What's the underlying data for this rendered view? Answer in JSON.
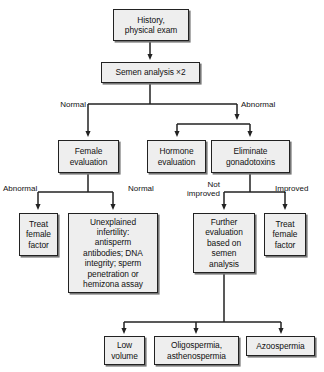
{
  "diagram": {
    "type": "flowchart",
    "colors": {
      "node_fill": "#eeeeee",
      "node_border": "#222222",
      "node_shadow": "#777777",
      "line": "#222222",
      "text": "#111111",
      "background": "#ffffff"
    },
    "nodes": [
      {
        "id": "history",
        "label": "History,\nphysical exam"
      },
      {
        "id": "semen",
        "label": "Semen analysis ×2"
      },
      {
        "id": "female_eval",
        "label": "Female\nevaluation"
      },
      {
        "id": "hormone_eval",
        "label": "Hormone\nevaluation"
      },
      {
        "id": "eliminate",
        "label": "Eliminate\ngonadotoxins"
      },
      {
        "id": "treat_left",
        "label": "Treat\nfemale\nfactor"
      },
      {
        "id": "unexplained",
        "label": "Unexplained\ninfertility:\nantisperm\nantibodies; DNA\nintegrity; sperm\npenetration or\nhemizona assay"
      },
      {
        "id": "further_eval",
        "label": "Further\nevaluation\nbased on\nsemen\nanalysis"
      },
      {
        "id": "treat_right",
        "label": "Treat\nfemale\nfactor"
      },
      {
        "id": "low_volume",
        "label": "Low\nvolume"
      },
      {
        "id": "oligo",
        "label": "Oligospermia,\nasthenospermia"
      },
      {
        "id": "azoo",
        "label": "Azoospermia"
      }
    ],
    "edge_labels": [
      {
        "id": "normal_top",
        "text": "Normal"
      },
      {
        "id": "abnormal_top",
        "text": "Abnormal"
      },
      {
        "id": "abnormal_female",
        "text": "Abnormal"
      },
      {
        "id": "normal_female",
        "text": "Normal"
      },
      {
        "id": "not_improved",
        "text": "Not\nimproved"
      },
      {
        "id": "improved",
        "text": "Improved"
      }
    ]
  }
}
